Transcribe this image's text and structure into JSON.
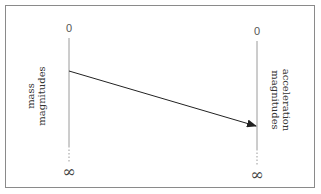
{
  "diagram": {
    "left_axis": {
      "label_line1": "mass",
      "label_line2": "magnitudes",
      "top_value": "0",
      "bottom_value": "∞"
    },
    "right_axis": {
      "label_line1": "acceleration",
      "label_line2": "magnitudes",
      "top_value": "0",
      "bottom_value": "∞"
    },
    "mapping_arrow": {
      "from": "left_axis",
      "to": "right_axis"
    },
    "colors": {
      "frame": "#8a8a8a",
      "axis": "#9a9a9a",
      "arrow": "#222222",
      "text": "#333333"
    }
  }
}
